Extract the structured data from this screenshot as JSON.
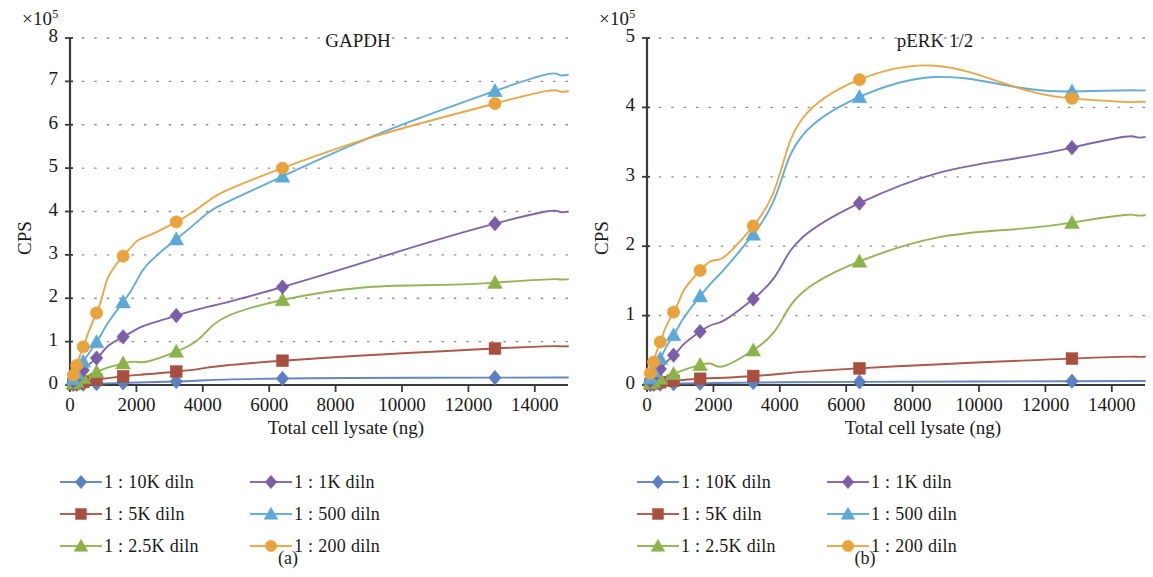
{
  "figure": {
    "panels": [
      {
        "id": "a",
        "subcaption": "(a)",
        "title": "GAPDH",
        "axis_multiplier": "×10",
        "axis_multiplier_exp": "5",
        "ylabel": "CPS",
        "xlabel": "Total cell lysate (ng)",
        "yticks": [
          "0",
          "1",
          "2",
          "3",
          "4",
          "5",
          "6",
          "7",
          "8"
        ],
        "xticks": [
          "0",
          "2000",
          "4000",
          "6000",
          "8000",
          "10000",
          "12000",
          "14000"
        ]
      },
      {
        "id": "b",
        "subcaption": "(b)",
        "title": "pERK 1/2",
        "axis_multiplier": "×10",
        "axis_multiplier_exp": "5",
        "ylabel": "CPS",
        "xlabel": "Total cell lysate (ng)",
        "yticks": [
          "0",
          "1",
          "2",
          "3",
          "4",
          "5"
        ],
        "xticks": [
          "0",
          "2000",
          "4000",
          "6000",
          "8000",
          "10000",
          "12000",
          "14000"
        ]
      }
    ],
    "legend": {
      "columns": [
        [
          {
            "label": "1 : 10K diln",
            "marker": "diamond",
            "color": "#5b7fc0"
          },
          {
            "label": "1 : 5K diln",
            "marker": "square",
            "color": "#a94f3f"
          },
          {
            "label": "1 : 2.5K diln",
            "marker": "triangle",
            "color": "#8cb24a"
          }
        ],
        [
          {
            "label": "1 : 1K diln",
            "marker": "diamond",
            "color": "#7b5ea7"
          },
          {
            "label": "1 : 500 diln",
            "marker": "triangle",
            "color": "#5ca8d6"
          },
          {
            "label": "1 : 200 diln",
            "marker": "circle",
            "color": "#e8a33d"
          }
        ]
      ]
    }
  },
  "chart_data": [
    {
      "type": "line",
      "panel": "a",
      "title": "GAPDH",
      "xlabel": "Total cell lysate (ng)",
      "ylabel": "CPS",
      "y_multiplier": 100000,
      "xlim": [
        0,
        15000
      ],
      "ylim": [
        0,
        800000
      ],
      "xticks": [
        0,
        2000,
        4000,
        6000,
        8000,
        10000,
        12000,
        14000
      ],
      "yticks": [
        0,
        100000,
        200000,
        300000,
        400000,
        500000,
        600000,
        700000,
        800000
      ],
      "grid": "dotted",
      "legend_position": "below",
      "x": [
        100,
        200,
        400,
        800,
        1600,
        3200,
        6400,
        12800
      ],
      "series": [
        {
          "name": "1 : 10K diln",
          "color": "#5b7fc0",
          "marker": "diamond",
          "values": [
            1000,
            1500,
            2000,
            3000,
            5000,
            8000,
            15000,
            17000
          ]
        },
        {
          "name": "1 : 5K diln",
          "color": "#a94f3f",
          "marker": "square",
          "values": [
            2000,
            4000,
            7000,
            12000,
            20000,
            31000,
            56000,
            84000
          ]
        },
        {
          "name": "1 : 2.5K diln",
          "color": "#8cb24a",
          "marker": "triangle",
          "values": [
            4000,
            8000,
            16000,
            30000,
            50000,
            77000,
            196000,
            236000
          ]
        },
        {
          "name": "1 : 1K diln",
          "color": "#7b5ea7",
          "marker": "diamond",
          "values": [
            9000,
            17000,
            34000,
            62000,
            111000,
            160000,
            226000,
            372000
          ]
        },
        {
          "name": "1 : 500 diln",
          "color": "#5ca8d6",
          "marker": "triangle",
          "values": [
            14000,
            27000,
            54000,
            99000,
            191000,
            336000,
            481000,
            678000
          ]
        },
        {
          "name": "1 : 200 diln",
          "color": "#e8a33d",
          "marker": "circle",
          "values": [
            23000,
            45000,
            88000,
            166000,
            297000,
            376000,
            500000,
            649000
          ]
        }
      ],
      "note_curve_extra": [
        {
          "name": "1 : 500 diln",
          "x": 12800,
          "y": 678000
        },
        {
          "name": "1 : 200 diln",
          "x": 12800,
          "y": 658000
        }
      ]
    },
    {
      "type": "line",
      "panel": "b",
      "title": "pERK 1/2",
      "xlabel": "Total cell lysate (ng)",
      "ylabel": "CPS",
      "y_multiplier": 100000,
      "xlim": [
        0,
        15000
      ],
      "ylim": [
        0,
        500000
      ],
      "xticks": [
        0,
        2000,
        4000,
        6000,
        8000,
        10000,
        12000,
        14000
      ],
      "yticks": [
        0,
        100000,
        200000,
        300000,
        400000,
        500000
      ],
      "grid": "dotted",
      "legend_position": "below",
      "x": [
        100,
        200,
        400,
        800,
        1600,
        3200,
        6400,
        12800
      ],
      "series": [
        {
          "name": "1 : 10K diln",
          "color": "#5b7fc0",
          "marker": "diamond",
          "values": [
            500,
            800,
            1200,
            1800,
            2500,
            3500,
            4500,
            5500
          ]
        },
        {
          "name": "1 : 5K diln",
          "color": "#a94f3f",
          "marker": "square",
          "values": [
            1500,
            2500,
            4000,
            6000,
            9000,
            13000,
            24000,
            38000
          ]
        },
        {
          "name": "1 : 2.5K diln",
          "color": "#8cb24a",
          "marker": "triangle",
          "values": [
            2500,
            5000,
            9000,
            16000,
            29000,
            50000,
            178000,
            234000
          ]
        },
        {
          "name": "1 : 1K diln",
          "color": "#7b5ea7",
          "marker": "diamond",
          "values": [
            6000,
            12000,
            23000,
            43000,
            77000,
            124000,
            262000,
            342000
          ]
        },
        {
          "name": "1 : 500 diln",
          "color": "#5ca8d6",
          "marker": "triangle",
          "values": [
            10000,
            20000,
            38000,
            72000,
            128000,
            217000,
            415000,
            423000
          ]
        },
        {
          "name": "1 : 200 diln",
          "color": "#e8a33d",
          "marker": "circle",
          "values": [
            17000,
            33000,
            62000,
            105000,
            165000,
            229000,
            440000,
            413000
          ]
        }
      ]
    }
  ]
}
